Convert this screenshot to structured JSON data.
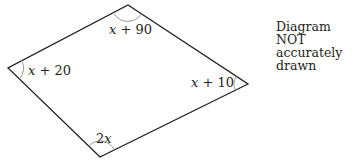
{
  "diagram": {
    "type": "quadrilateral",
    "note_lines": [
      "Diagram NOT",
      "accurately drawn"
    ],
    "vertices": [
      {
        "id": "top",
        "angle": {
          "variable": "x",
          "suffix": " + 90"
        }
      },
      {
        "id": "right",
        "angle": {
          "variable": "x",
          "suffix": " + 10"
        }
      },
      {
        "id": "bottom",
        "angle": {
          "prefix": "2",
          "variable": "x",
          "suffix": ""
        }
      },
      {
        "id": "left",
        "angle": {
          "variable": "x",
          "suffix": " + 20"
        }
      }
    ],
    "colors": {
      "stroke": "#231f20",
      "arc": "#9a9a9a",
      "text": "#231f20"
    }
  }
}
